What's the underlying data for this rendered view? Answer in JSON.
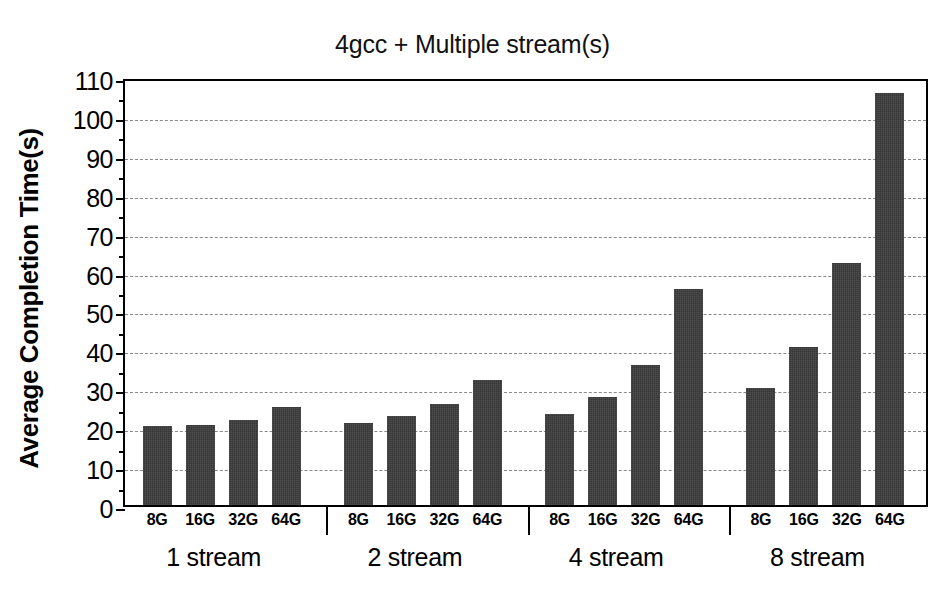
{
  "chart_data": {
    "type": "bar",
    "title": "4gcc + Multiple stream(s)",
    "xlabel": "",
    "ylabel": "Average Completion Time(s)",
    "ylim": [
      0,
      110
    ],
    "ytick_step": 10,
    "ytick_labels": [
      "0",
      "10",
      "20",
      "30",
      "40",
      "50",
      "60",
      "70",
      "80",
      "90",
      "100",
      "110"
    ],
    "grid": "horizontal-dashed",
    "legend": "none",
    "categories": [
      "8G",
      "16G",
      "32G",
      "64G"
    ],
    "groups": [
      {
        "label": "1 stream",
        "categories": [
          "8G",
          "16G",
          "32G",
          "64G"
        ],
        "values": [
          20.2,
          20.6,
          21.8,
          25.2
        ]
      },
      {
        "label": "2 stream",
        "categories": [
          "8G",
          "16G",
          "32G",
          "64G"
        ],
        "values": [
          21.2,
          22.8,
          26.0,
          32.1
        ]
      },
      {
        "label": "4 stream",
        "categories": [
          "8G",
          "16G",
          "32G",
          "64G"
        ],
        "values": [
          23.4,
          27.7,
          36.0,
          55.5
        ]
      },
      {
        "label": "8 stream",
        "categories": [
          "8G",
          "16G",
          "32G",
          "64G"
        ],
        "values": [
          30.2,
          40.6,
          62.3,
          106.0
        ]
      }
    ],
    "bar_color": "#3b3b3b",
    "grid_color": "#8a8a8a",
    "axis_color": "#000000",
    "background": "#ffffff"
  }
}
